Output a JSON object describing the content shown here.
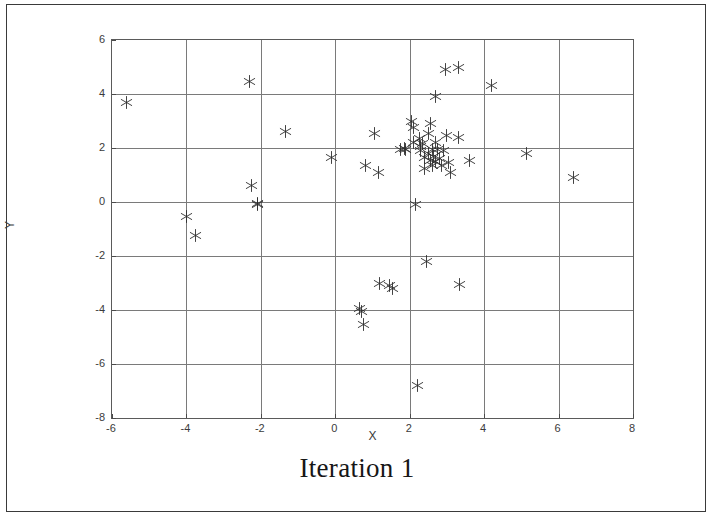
{
  "figure": {
    "title": "Iteration 1",
    "border_color": "#3a3a3a",
    "background": "#ffffff"
  },
  "axes": {
    "xlabel": "X",
    "ylabel": "Y",
    "x_ticks": [
      "-6",
      "-4",
      "-2",
      "0",
      "2",
      "4",
      "6",
      "8"
    ],
    "y_ticks": [
      "6",
      "4",
      "2",
      "0",
      "-2",
      "-4",
      "-6",
      "-8"
    ],
    "grid_color": "#7a7a7a",
    "axis_color": "#5a5a5a"
  },
  "chart_data": {
    "type": "scatter",
    "title": "Iteration 1",
    "xlabel": "X",
    "ylabel": "Y",
    "xlim": [
      -6,
      8
    ],
    "ylim": [
      -8,
      6
    ],
    "xticks": [
      -6,
      -4,
      -2,
      0,
      2,
      4,
      6,
      8
    ],
    "yticks": [
      -8,
      -6,
      -4,
      -2,
      0,
      2,
      4,
      6
    ],
    "grid": true,
    "legend": null,
    "marker": "asterisk",
    "marker_color": "#2e2e2e",
    "series": [
      {
        "name": "data",
        "points": [
          [
            -5.6,
            3.7
          ],
          [
            -4.0,
            -0.55
          ],
          [
            -3.75,
            -1.25
          ],
          [
            -2.3,
            4.45
          ],
          [
            -2.25,
            0.6
          ],
          [
            -2.1,
            -0.05
          ],
          [
            -2.1,
            -0.1
          ],
          [
            -1.35,
            2.6
          ],
          [
            -0.1,
            1.65
          ],
          [
            0.65,
            -3.95
          ],
          [
            0.7,
            -4.05
          ],
          [
            0.75,
            -4.55
          ],
          [
            0.8,
            1.35
          ],
          [
            1.05,
            2.55
          ],
          [
            1.15,
            1.1
          ],
          [
            1.2,
            -3.0
          ],
          [
            1.45,
            -3.1
          ],
          [
            1.55,
            -3.2
          ],
          [
            1.75,
            1.95
          ],
          [
            1.85,
            2.0
          ],
          [
            1.9,
            1.95
          ],
          [
            2.05,
            3.0
          ],
          [
            2.1,
            2.75
          ],
          [
            2.1,
            2.2
          ],
          [
            2.15,
            -0.1
          ],
          [
            2.2,
            -6.8
          ],
          [
            2.25,
            2.35
          ],
          [
            2.3,
            2.05
          ],
          [
            2.3,
            1.9
          ],
          [
            2.35,
            2.15
          ],
          [
            2.4,
            1.65
          ],
          [
            2.4,
            1.25
          ],
          [
            2.45,
            -2.2
          ],
          [
            2.5,
            2.55
          ],
          [
            2.5,
            1.8
          ],
          [
            2.55,
            1.55
          ],
          [
            2.55,
            2.9
          ],
          [
            2.6,
            1.95
          ],
          [
            2.6,
            1.35
          ],
          [
            2.65,
            1.7
          ],
          [
            2.7,
            3.9
          ],
          [
            2.7,
            2.2
          ],
          [
            2.7,
            1.5
          ],
          [
            2.75,
            1.95
          ],
          [
            2.8,
            1.6
          ],
          [
            2.85,
            1.35
          ],
          [
            2.9,
            1.9
          ],
          [
            2.95,
            4.9
          ],
          [
            3.0,
            2.45
          ],
          [
            3.05,
            1.45
          ],
          [
            3.1,
            1.1
          ],
          [
            3.3,
            5.0
          ],
          [
            3.3,
            2.4
          ],
          [
            3.35,
            -3.05
          ],
          [
            3.6,
            1.55
          ],
          [
            4.2,
            4.3
          ],
          [
            5.15,
            1.8
          ],
          [
            6.4,
            0.9
          ]
        ]
      }
    ]
  }
}
